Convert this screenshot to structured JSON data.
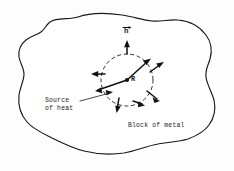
{
  "figure": {
    "type": "hand-drawn-physics-diagram",
    "background_color": "#fdfdfd",
    "ink_color": "#1a1a1a",
    "labels": {
      "vector_h": "h",
      "source_point": "R",
      "source_caption_line1": "Source",
      "source_caption_line2": "of heat",
      "block_caption": "Block of metal"
    },
    "elements": {
      "blob_outline_name": "block-of-metal-outline",
      "dashed_circle_name": "control-surface-dashed-circle",
      "flux_arrow_count": 6,
      "normal_vector_name": "unit-normal-vector-h",
      "leader_line_name": "source-of-heat-leader-line"
    },
    "geometry": {
      "canvas_width": 234,
      "canvas_height": 171,
      "source_point_x": 127,
      "source_point_y": 80,
      "dashed_circle_radius": 26
    }
  }
}
